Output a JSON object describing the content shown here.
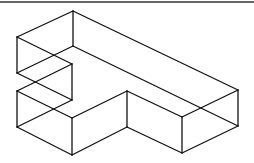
{
  "diagram": {
    "title": "",
    "type": "isometric-wireframe",
    "stroke_color": "#111111",
    "background": "#ffffff",
    "border_top": {
      "x1": 0,
      "y1": 2,
      "x2": 254,
      "y2": 2
    },
    "edges": [
      [
        73,
        11,
        238,
        90
      ],
      [
        73,
        11,
        17,
        37
      ],
      [
        73,
        11,
        73,
        46
      ],
      [
        17,
        37,
        17,
        73
      ],
      [
        17,
        37,
        72,
        64
      ],
      [
        72,
        64,
        72,
        100
      ],
      [
        73,
        46,
        238,
        126
      ],
      [
        73,
        46,
        17,
        73
      ],
      [
        17,
        73,
        72,
        100
      ],
      [
        72,
        64,
        17,
        91
      ],
      [
        17,
        91,
        17,
        127
      ],
      [
        17,
        91,
        72,
        118
      ],
      [
        72,
        118,
        127,
        91
      ],
      [
        72,
        100,
        17,
        127
      ],
      [
        17,
        127,
        72,
        155
      ],
      [
        72,
        118,
        72,
        155
      ],
      [
        72,
        155,
        127,
        127
      ],
      [
        127,
        91,
        127,
        127
      ],
      [
        127,
        91,
        182,
        117
      ],
      [
        127,
        127,
        182,
        153
      ],
      [
        182,
        117,
        182,
        153
      ],
      [
        182,
        117,
        238,
        90
      ],
      [
        182,
        153,
        238,
        126
      ],
      [
        238,
        90,
        238,
        126
      ]
    ]
  }
}
